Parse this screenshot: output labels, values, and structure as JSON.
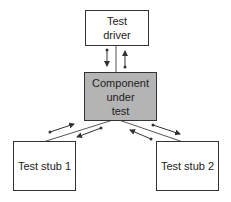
{
  "diagram": {
    "nodes": [
      {
        "id": "driver",
        "lines": [
          "Test",
          "driver"
        ],
        "fill": "#ffffff"
      },
      {
        "id": "component",
        "lines": [
          "Component",
          "under",
          "test"
        ],
        "fill": "#b4b4b4"
      },
      {
        "id": "stub1",
        "lines": [
          "Test stub 1"
        ],
        "fill": "#ffffff"
      },
      {
        "id": "stub2",
        "lines": [
          "Test stub 2"
        ],
        "fill": "#ffffff"
      }
    ],
    "edges": [
      {
        "from": "driver",
        "to": "component",
        "arrows": "bidirectional"
      },
      {
        "from": "component",
        "to": "stub1",
        "arrows": "bidirectional"
      },
      {
        "from": "component",
        "to": "stub2",
        "arrows": "bidirectional"
      }
    ],
    "colors": {
      "line": "#333333",
      "component_fill": "#b4b4b4"
    }
  }
}
